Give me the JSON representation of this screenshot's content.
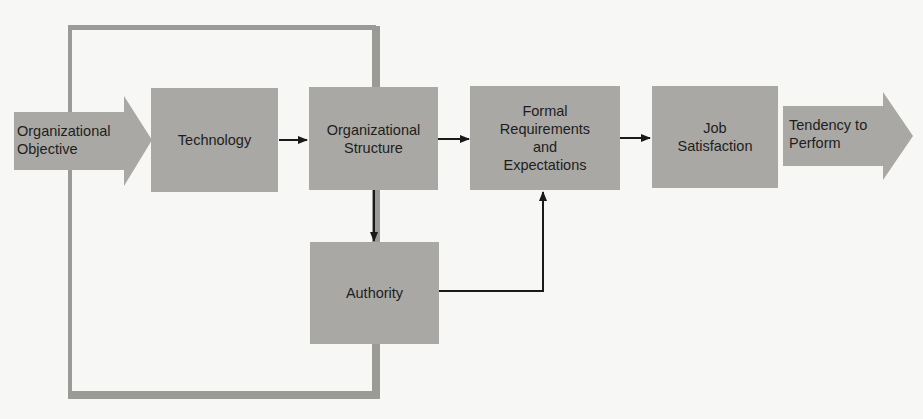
{
  "diagram": {
    "type": "flow",
    "colors": {
      "box_fill": "#a9a8a4",
      "frame": "#9a9a96",
      "arrow_line": "#1a1a1a",
      "background": "#f7f7f5"
    },
    "input": {
      "id": "organizational-objective",
      "label": "Organizational\nObjective"
    },
    "nodes": [
      {
        "id": "technology",
        "label": "Technology"
      },
      {
        "id": "organizational-structure",
        "label": "Organizational\nStructure"
      },
      {
        "id": "formal-requirements",
        "label": "Formal\nRequirements\nand\nExpectations"
      },
      {
        "id": "job-satisfaction",
        "label": "Job\nSatisfaction"
      },
      {
        "id": "authority",
        "label": "Authority"
      }
    ],
    "output": {
      "id": "tendency-to-perform",
      "label": "Tendency to\nPerform"
    },
    "edges": [
      {
        "from": "organizational-objective",
        "to": "technology"
      },
      {
        "from": "technology",
        "to": "organizational-structure"
      },
      {
        "from": "organizational-structure",
        "to": "formal-requirements"
      },
      {
        "from": "formal-requirements",
        "to": "job-satisfaction"
      },
      {
        "from": "job-satisfaction",
        "to": "tendency-to-perform"
      },
      {
        "from": "organizational-structure",
        "to": "authority"
      },
      {
        "from": "authority",
        "to": "formal-requirements"
      }
    ]
  }
}
